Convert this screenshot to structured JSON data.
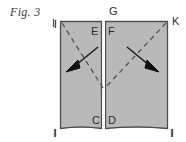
{
  "figure": {
    "caption": "Fig. 3",
    "background_color": "#ffffff",
    "panel_fill": "#b9b9b9",
    "panel_stroke": "#4d4d4d",
    "seam_color": "#ffffff",
    "dash_color": "#4a4a4a",
    "arrow_color": "#1a1a1a",
    "label_color": "#2e2e2e"
  },
  "labels": {
    "top_left_corner": "I",
    "top_center": "G",
    "top_right_corner": "K",
    "inner_left_top": "E",
    "inner_right_top": "F",
    "inner_left_bottom": "C",
    "inner_right_bottom": "D",
    "bottom_left_corner": "I",
    "bottom_right_corner": "I"
  },
  "annotations": {
    "left_arrow_direction": "down-left",
    "right_arrow_direction": "down-right",
    "left_dashed_axis": "top-left to center",
    "right_dashed_axis": "top-right to center"
  }
}
